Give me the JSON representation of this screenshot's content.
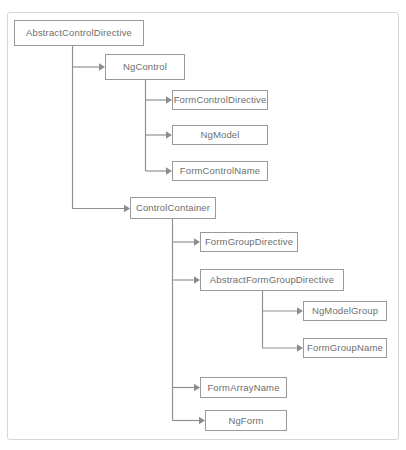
{
  "diagram": {
    "type": "class-hierarchy-tree",
    "title": "",
    "colors": {
      "node_border": "#9a9a9a",
      "node_fill": "#ffffff",
      "node_text": "#6e6e6e",
      "edge": "#8d8d8d",
      "frame_border": "#d6d6d6",
      "background": "#ffffff"
    },
    "nodes": [
      {
        "id": "abstract-control-directive",
        "label": "AbstractControlDirective",
        "x": 14,
        "y": 20,
        "w": 130,
        "h": 26,
        "level": 0
      },
      {
        "id": "ng-control",
        "label": "NgControl",
        "x": 105,
        "y": 54,
        "w": 80,
        "h": 26,
        "level": 1
      },
      {
        "id": "form-control-directive",
        "label": "FormControlDirective",
        "x": 172,
        "y": 90,
        "w": 96,
        "h": 20,
        "level": 2
      },
      {
        "id": "ng-model",
        "label": "NgModel",
        "x": 172,
        "y": 125,
        "w": 96,
        "h": 20,
        "level": 2
      },
      {
        "id": "form-control-name",
        "label": "FormControlName",
        "x": 172,
        "y": 161,
        "w": 96,
        "h": 20,
        "level": 2
      },
      {
        "id": "control-container",
        "label": "ControlContainer",
        "x": 130,
        "y": 197,
        "w": 86,
        "h": 22,
        "level": 1
      },
      {
        "id": "form-group-directive",
        "label": "FormGroupDirective",
        "x": 200,
        "y": 232,
        "w": 98,
        "h": 20,
        "level": 2
      },
      {
        "id": "abstract-form-group-directive",
        "label": "AbstractFormGroupDirective",
        "x": 200,
        "y": 269,
        "w": 144,
        "h": 22,
        "level": 2
      },
      {
        "id": "ng-model-group",
        "label": "NgModelGroup",
        "x": 303,
        "y": 301,
        "w": 84,
        "h": 20,
        "level": 3
      },
      {
        "id": "form-group-name",
        "label": "FormGroupName",
        "x": 303,
        "y": 338,
        "w": 84,
        "h": 20,
        "level": 3
      },
      {
        "id": "form-array-name",
        "label": "FormArrayName",
        "x": 200,
        "y": 377,
        "w": 87,
        "h": 21,
        "level": 2
      },
      {
        "id": "ng-form",
        "label": "NgForm",
        "x": 205,
        "y": 410,
        "w": 82,
        "h": 21,
        "level": 2
      }
    ],
    "edges": [
      {
        "from": "abstract-control-directive",
        "to": "ng-control"
      },
      {
        "from": "abstract-control-directive",
        "to": "control-container"
      },
      {
        "from": "ng-control",
        "to": "form-control-directive"
      },
      {
        "from": "ng-control",
        "to": "ng-model"
      },
      {
        "from": "ng-control",
        "to": "form-control-name"
      },
      {
        "from": "control-container",
        "to": "form-group-directive"
      },
      {
        "from": "control-container",
        "to": "abstract-form-group-directive"
      },
      {
        "from": "control-container",
        "to": "form-array-name"
      },
      {
        "from": "control-container",
        "to": "ng-form"
      },
      {
        "from": "abstract-form-group-directive",
        "to": "ng-model-group"
      },
      {
        "from": "abstract-form-group-directive",
        "to": "form-group-name"
      }
    ]
  }
}
